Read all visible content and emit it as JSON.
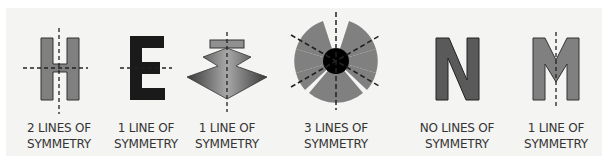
{
  "figure": {
    "items": [
      {
        "glyph": "H",
        "label_line1": "2 LINES OF",
        "label_line2": "SYMMETRY",
        "lines_of_symmetry": 2
      },
      {
        "glyph": "E",
        "label_line1": "1 LINE OF",
        "label_line2": "SYMMETRY",
        "lines_of_symmetry": 1
      },
      {
        "glyph": "stacked-arrow-shape",
        "label_line1": "1 LINE OF",
        "label_line2": "SYMMETRY",
        "lines_of_symmetry": 1
      },
      {
        "glyph": "trefoil-shape",
        "label_line1": "3 LINES OF",
        "label_line2": "SYMMETRY",
        "lines_of_symmetry": 3
      },
      {
        "glyph": "N",
        "label_line1": "NO LINES OF",
        "label_line2": "SYMMETRY",
        "lines_of_symmetry": 0
      },
      {
        "glyph": "M",
        "label_line1": "1 LINE OF",
        "label_line2": "SYMMETRY",
        "lines_of_symmetry": 1
      }
    ],
    "colors": {
      "shape_gray": "#808080",
      "shape_dark": "#1a1a1a",
      "outline": "#333333",
      "background": "#f4f4f2"
    }
  }
}
